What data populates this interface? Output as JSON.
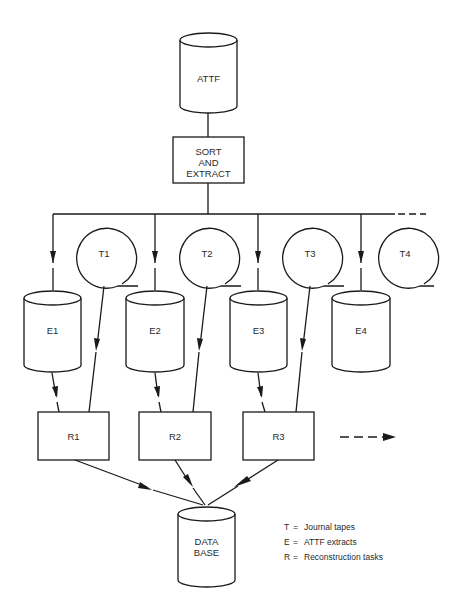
{
  "diagram": {
    "source": {
      "id": "attf",
      "label": "ATTF",
      "shape": "cylinder"
    },
    "process": {
      "id": "sort-extract",
      "lines": [
        "SORT",
        "AND",
        "EXTRACT"
      ],
      "shape": "box"
    },
    "tapes": [
      {
        "id": "t1",
        "label": "T1"
      },
      {
        "id": "t2",
        "label": "T2"
      },
      {
        "id": "t3",
        "label": "T3"
      },
      {
        "id": "t4",
        "label": "T4"
      }
    ],
    "extracts": [
      {
        "id": "e1",
        "label": "E1"
      },
      {
        "id": "e2",
        "label": "E2"
      },
      {
        "id": "e3",
        "label": "E3"
      },
      {
        "id": "e4",
        "label": "E4"
      }
    ],
    "tasks": [
      {
        "id": "r1",
        "label": "R1"
      },
      {
        "id": "r2",
        "label": "R2"
      },
      {
        "id": "r3",
        "label": "R3"
      }
    ],
    "sink": {
      "id": "database",
      "lines": [
        "DATA",
        "BASE"
      ],
      "shape": "cylinder"
    },
    "legend": [
      {
        "key": "T",
        "eq": "=",
        "text": "Journal tapes"
      },
      {
        "key": "E",
        "eq": "=",
        "text": "ATTF extracts"
      },
      {
        "key": "R",
        "eq": "=",
        "text": "Reconstruction tasks"
      }
    ],
    "colors": {
      "line": "#1a1a1a",
      "text": "#2a2a2a",
      "background": "#ffffff"
    }
  }
}
